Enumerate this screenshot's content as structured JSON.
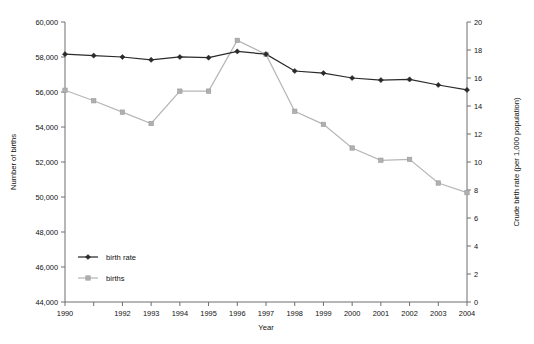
{
  "chart_data": {
    "type": "line",
    "title": "",
    "xlabel": "Year",
    "ylabel": "Number of births",
    "y2label": "Crude birth rate (per 1,000 population)",
    "grid": false,
    "legend_position": "inside-lower-left",
    "x": [
      1990,
      1991,
      1992,
      1993,
      1994,
      1995,
      1996,
      1997,
      1998,
      1999,
      2000,
      2001,
      2002,
      2003,
      2004
    ],
    "xtick_labels": [
      "1990",
      "",
      "1992",
      "1993",
      "1994",
      "1995",
      "1996",
      "1997",
      "1998",
      "1999",
      "2000",
      "2001",
      "2002",
      "2003",
      "2004"
    ],
    "ylim": [
      44000,
      60000
    ],
    "ytick_labels": [
      "44,000",
      "46,000",
      "48,000",
      "50,000",
      "52,000",
      "54,000",
      "56,000",
      "58,000",
      "60,000"
    ],
    "yticks": [
      44000,
      46000,
      48000,
      50000,
      52000,
      54000,
      56000,
      58000,
      60000
    ],
    "y2lim": [
      0,
      20
    ],
    "y2ticks": [
      0,
      2,
      4,
      6,
      8,
      10,
      12,
      14,
      16,
      18,
      20
    ],
    "y2tick_labels": [
      "0",
      "2",
      "4",
      "6",
      "8",
      "10",
      "12",
      "14",
      "16",
      "18",
      "20"
    ],
    "series": [
      {
        "name": "birth rate",
        "axis": "right",
        "color": "#2a2a2a",
        "marker": "diamond",
        "values": [
          17.7,
          17.6,
          17.5,
          17.3,
          17.5,
          17.45,
          17.9,
          17.7,
          16.5,
          16.35,
          16.0,
          15.85,
          15.9,
          15.5,
          15.15
        ]
      },
      {
        "name": "births",
        "axis": "left",
        "color": "#b0b0b0",
        "marker": "square",
        "values": [
          56100,
          55500,
          54850,
          54200,
          56050,
          56050,
          58950,
          58150,
          54900,
          54150,
          52800,
          52100,
          52150,
          50800,
          50250
        ]
      }
    ],
    "legend": [
      {
        "label": "birth rate",
        "color": "#2a2a2a",
        "marker": "diamond"
      },
      {
        "label": "births",
        "color": "#b0b0b0",
        "marker": "square"
      }
    ]
  }
}
